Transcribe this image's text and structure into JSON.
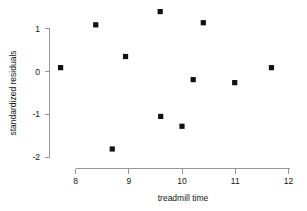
{
  "chart_data": {
    "type": "scatter",
    "title": "",
    "xlabel": "treadmill time",
    "ylabel": "standardized residuals",
    "xlim": [
      7.55,
      12.05
    ],
    "ylim": [
      -2.05,
      1.55
    ],
    "xticks": [
      8,
      9,
      10,
      11,
      12
    ],
    "xtick_labels": [
      "8",
      "9",
      "10",
      "11",
      "12"
    ],
    "yticks": [
      1,
      0,
      -1,
      -2
    ],
    "ytick_labels": [
      "1",
      "0",
      "-1",
      "-2"
    ],
    "grid": false,
    "legend": null,
    "marker": "filled-square",
    "marker_color": "#111111",
    "points": [
      {
        "x": 7.72,
        "y": 0.09
      },
      {
        "x": 8.38,
        "y": 1.09
      },
      {
        "x": 8.69,
        "y": -1.81
      },
      {
        "x": 8.94,
        "y": 0.35
      },
      {
        "x": 9.59,
        "y": 1.4
      },
      {
        "x": 9.6,
        "y": -1.05
      },
      {
        "x": 10.0,
        "y": -1.28
      },
      {
        "x": 10.21,
        "y": -0.19
      },
      {
        "x": 10.4,
        "y": 1.14
      },
      {
        "x": 10.99,
        "y": -0.26
      },
      {
        "x": 11.68,
        "y": 0.09
      }
    ]
  },
  "axes": {
    "x_axis_name": "x-axis",
    "y_axis_name": "y-axis"
  }
}
